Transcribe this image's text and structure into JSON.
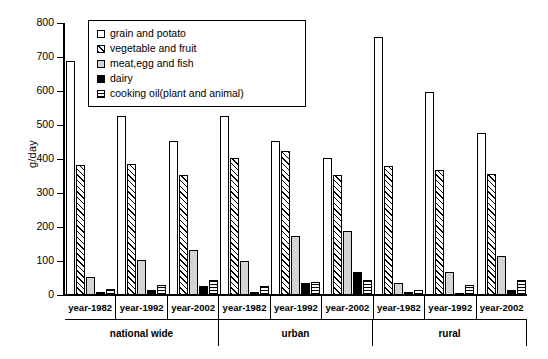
{
  "chart_data": {
    "type": "bar",
    "title": "",
    "xlabel": "",
    "ylabel": "g/day",
    "ylim": [
      0,
      800
    ],
    "yticks": [
      0,
      100,
      200,
      300,
      400,
      500,
      600,
      700,
      800
    ],
    "grid": false,
    "legend_position": "top-center",
    "categories": [
      "year-1982",
      "year-1992",
      "year-2002",
      "year-1982",
      "year-1992",
      "year-2002",
      "year-1982",
      "year-1992",
      "year-2002"
    ],
    "groups": [
      {
        "label": "national wide",
        "span": 3
      },
      {
        "label": "urban",
        "span": 3
      },
      {
        "label": "rural",
        "span": 3
      }
    ],
    "series": [
      {
        "name": "grain and potato",
        "pattern": "open-white",
        "values": [
          688,
          527,
          452,
          527,
          453,
          402,
          760,
          598,
          476
        ]
      },
      {
        "name": "vegetable and fruit",
        "pattern": "diagonal-hatch",
        "values": [
          382,
          385,
          352,
          402,
          425,
          352,
          378,
          367,
          355
        ]
      },
      {
        "name": "meat,egg and fish",
        "pattern": "light-gray",
        "values": [
          53,
          103,
          133,
          101,
          175,
          187,
          34,
          68,
          116
        ]
      },
      {
        "name": "dairy",
        "pattern": "solid-black",
        "values": [
          8,
          14,
          26,
          10,
          36,
          68,
          9,
          5,
          14
        ]
      },
      {
        "name": "cooking oil(plant and animal)",
        "pattern": "horizontal-stripes",
        "values": [
          17,
          29,
          43,
          27,
          38,
          45,
          15,
          28,
          43
        ]
      }
    ]
  },
  "legend": {
    "items": [
      {
        "label": "grain and potato"
      },
      {
        "label": "vegetable and fruit"
      },
      {
        "label": "meat,egg and fish"
      },
      {
        "label": "dairy"
      },
      {
        "label": "cooking oil(plant and animal)"
      }
    ]
  }
}
